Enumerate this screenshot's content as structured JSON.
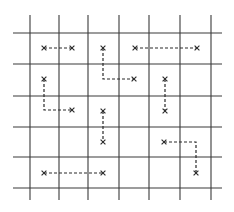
{
  "diagram": {
    "title": "",
    "colors": {
      "grid": "#3a3a3a",
      "path": "#2a2a2a",
      "background": "#ffffff"
    },
    "grid": {
      "vertical_x": [
        30,
        59,
        88,
        119,
        149,
        180,
        211
      ],
      "vertical_extent": [
        15,
        200
      ],
      "horizontal_y": [
        33,
        64,
        96,
        127,
        157,
        188
      ],
      "horizontal_extent": [
        13,
        222
      ]
    },
    "paths": [
      {
        "id": "p1",
        "points": [
          [
            44,
            48
          ],
          [
            72,
            48
          ]
        ]
      },
      {
        "id": "p2",
        "points": [
          [
            103,
            48
          ],
          [
            103,
            79
          ],
          [
            134,
            79
          ]
        ]
      },
      {
        "id": "p3",
        "points": [
          [
            135,
            48
          ],
          [
            197,
            48
          ]
        ]
      },
      {
        "id": "p4",
        "points": [
          [
            44,
            79
          ],
          [
            44,
            110
          ],
          [
            72,
            110
          ]
        ]
      },
      {
        "id": "p5",
        "points": [
          [
            165,
            79
          ],
          [
            165,
            111
          ]
        ]
      },
      {
        "id": "p6",
        "points": [
          [
            103,
            111
          ],
          [
            103,
            142
          ]
        ]
      },
      {
        "id": "p7",
        "points": [
          [
            164,
            142
          ],
          [
            196,
            142
          ],
          [
            196,
            173
          ]
        ]
      },
      {
        "id": "p8",
        "points": [
          [
            44,
            173
          ],
          [
            103,
            173
          ]
        ]
      }
    ],
    "endpoint_marker": "x-mark"
  }
}
